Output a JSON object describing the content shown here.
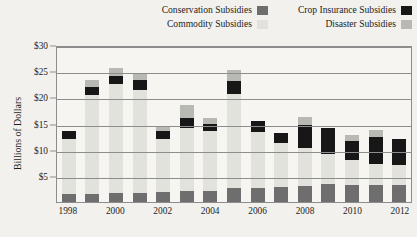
{
  "legend": {
    "items": [
      {
        "label": "Conservation Subsidies",
        "color": "#6e6e6e",
        "key": "conservation"
      },
      {
        "label": "Crop Insurance Subsidies",
        "color": "#171717",
        "key": "crop_insurance"
      },
      {
        "label": "Commodity Subsidies",
        "color": "#e2e2dd",
        "key": "commodity"
      },
      {
        "label": "Disaster Subsidies",
        "color": "#b9b9b4",
        "key": "disaster"
      }
    ]
  },
  "axes": {
    "y_title": "Billions of Dollars",
    "y_ticks": [
      "$30",
      "$25",
      "$20",
      "$15",
      "$10",
      "$5"
    ],
    "y_tick_values": [
      30,
      25,
      20,
      15,
      10,
      5
    ],
    "y_min": 0,
    "y_max": 30,
    "x_ticks": [
      "1998",
      "",
      "2000",
      "",
      "2002",
      "",
      "2004",
      "",
      "2006",
      "",
      "2008",
      "",
      "2010",
      "",
      "2012"
    ]
  },
  "chart_data": {
    "type": "bar",
    "stacked": true,
    "title": "",
    "xlabel": "",
    "ylabel": "Billions of Dollars",
    "ylim": [
      0,
      30
    ],
    "grid": true,
    "legend_position": "top",
    "categories": [
      "1998",
      "1999",
      "2000",
      "2001",
      "2002",
      "2003",
      "2004",
      "2005",
      "2006",
      "2007",
      "2008",
      "2009",
      "2010",
      "2011",
      "2012"
    ],
    "series": [
      {
        "name": "Conservation Subsidies",
        "color": "#6e6e6e",
        "values": [
          1.6,
          1.6,
          1.8,
          1.8,
          1.9,
          2.1,
          2.2,
          2.6,
          2.6,
          2.8,
          3.1,
          3.4,
          3.3,
          3.3,
          3.2
        ]
      },
      {
        "name": "Commodity Subsidies",
        "color": "#e2e2dd",
        "values": [
          10.4,
          18.8,
          20.7,
          19.6,
          10.1,
          12.0,
          11.3,
          18.0,
          10.7,
          8.5,
          7.3,
          5.8,
          4.7,
          4.0,
          3.8
        ]
      },
      {
        "name": "Crop Insurance Subsidies",
        "color": "#171717",
        "values": [
          1.5,
          1.5,
          1.6,
          2.0,
          1.6,
          2.0,
          1.5,
          2.6,
          2.1,
          1.9,
          4.4,
          4.9,
          3.7,
          5.2,
          5.1
        ]
      },
      {
        "name": "Disaster Subsidies",
        "color": "#b9b9b4",
        "values": [
          0.0,
          1.5,
          1.6,
          1.1,
          0.8,
          2.5,
          1.0,
          2.1,
          0.0,
          0.0,
          1.5,
          0.0,
          1.2,
          1.2,
          0.0
        ]
      }
    ],
    "totals": [
      13.5,
      23.4,
      25.7,
      24.5,
      14.4,
      18.6,
      16.0,
      25.3,
      15.4,
      13.2,
      16.3,
      14.1,
      12.9,
      13.7,
      12.1
    ]
  }
}
